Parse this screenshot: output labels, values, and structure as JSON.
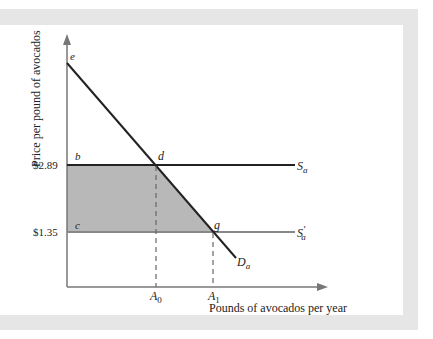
{
  "figure": {
    "y_axis_label": "Price per pound of avocados",
    "x_axis_label": "Pounds of avocados per year",
    "price_high": "$2.89",
    "price_low": "$1.35",
    "points": {
      "e": "e",
      "b": "b",
      "d": "d",
      "c": "c",
      "g": "g"
    },
    "quantities": {
      "a0_base": "A",
      "a0_sub": "0",
      "a1_base": "A",
      "a1_sub": "1"
    },
    "curves": {
      "supply": {
        "base": "S",
        "sub": "a"
      },
      "supply_new": {
        "base": "S",
        "prime": "′",
        "sub": "a"
      },
      "demand": {
        "base": "D",
        "sub": "a"
      }
    },
    "colors": {
      "frame": "#e6e6e6",
      "axis": "#777777",
      "curve": "#222222",
      "shade": "#b8b8b8",
      "supply_new_line": "#888888"
    }
  }
}
